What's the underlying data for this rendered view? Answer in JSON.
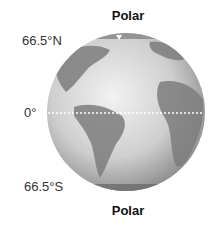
{
  "labels": {
    "north_polar": "Polar",
    "south_polar": "Polar",
    "lat_north": "66.5°N",
    "equator": "0°",
    "lat_south": "66.5°S"
  },
  "globe": {
    "ocean_color": "#d9d9d9",
    "land_color": "#7a7a7a",
    "equator_line_color": "#ffffff"
  }
}
